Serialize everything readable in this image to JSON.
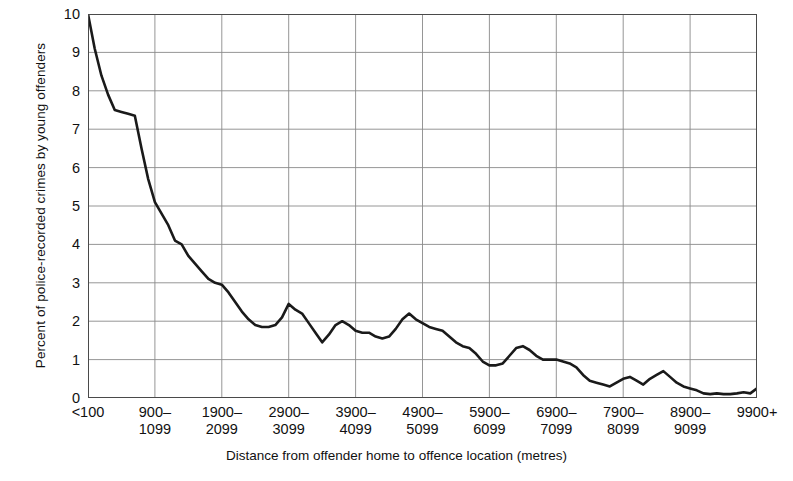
{
  "chart_data": {
    "type": "line",
    "title": "",
    "subtitle": "",
    "xlabel": "Distance from offender home to offence location (metres)",
    "ylabel": "Percent of police-recorded crimes by young offenders",
    "xlim": [
      0,
      100
    ],
    "ylim": [
      0,
      10
    ],
    "grid": true,
    "legend": null,
    "y_ticks": [
      10,
      9,
      8,
      7,
      6,
      5,
      4,
      3,
      2,
      1,
      0
    ],
    "y_tick_labels": [
      "10",
      "9",
      "8",
      "7",
      "6",
      "5",
      "4",
      "3",
      "2",
      "1",
      "0"
    ],
    "x_tick_positions": [
      0,
      10,
      20,
      30,
      40,
      50,
      60,
      70,
      80,
      90,
      100
    ],
    "x_tick_labels": [
      "<100",
      "900–\n1099",
      "1900–\n2099",
      "2900–\n3099",
      "3900–\n4099",
      "4900–\n5099",
      "5900–\n6099",
      "6900–\n7099",
      "7900–\n8099",
      "8900–\n9099",
      "9900+"
    ],
    "line_color": "#1a1a1a",
    "line_width": 2.6,
    "axis_color": "#4a4a4a",
    "grid_color": "#8a8a8a",
    "series": [
      {
        "name": "Percent of police-recorded crimes by young offenders",
        "x": [
          0,
          1,
          2,
          3,
          4,
          5,
          6,
          7,
          8,
          9,
          10,
          11,
          12,
          13,
          14,
          15,
          16,
          17,
          18,
          19,
          20,
          21,
          22,
          23,
          24,
          25,
          26,
          27,
          28,
          29,
          30,
          31,
          32,
          33,
          34,
          35,
          36,
          37,
          38,
          39,
          40,
          41,
          42,
          43,
          44,
          45,
          46,
          47,
          48,
          49,
          50,
          51,
          52,
          53,
          54,
          55,
          56,
          57,
          58,
          59,
          60,
          61,
          62,
          63,
          64,
          65,
          66,
          67,
          68,
          69,
          70,
          71,
          72,
          73,
          74,
          75,
          76,
          77,
          78,
          79,
          80,
          81,
          82,
          83,
          84,
          85,
          86,
          87,
          88,
          89,
          90,
          91,
          92,
          93,
          94,
          95,
          96,
          97,
          98,
          99,
          100
        ],
        "values": [
          10.0,
          9.1,
          8.4,
          7.9,
          7.5,
          7.45,
          7.4,
          7.35,
          6.5,
          5.7,
          5.1,
          4.8,
          4.5,
          4.1,
          4.0,
          3.7,
          3.5,
          3.3,
          3.1,
          3.0,
          2.95,
          2.75,
          2.5,
          2.25,
          2.05,
          1.9,
          1.85,
          1.85,
          1.9,
          2.1,
          2.45,
          2.3,
          2.2,
          1.95,
          1.7,
          1.45,
          1.65,
          1.9,
          2.0,
          1.9,
          1.75,
          1.7,
          1.7,
          1.6,
          1.55,
          1.6,
          1.8,
          2.05,
          2.2,
          2.05,
          1.95,
          1.85,
          1.8,
          1.75,
          1.6,
          1.45,
          1.35,
          1.3,
          1.15,
          0.95,
          0.85,
          0.85,
          0.9,
          1.1,
          1.3,
          1.35,
          1.25,
          1.1,
          1.0,
          1.0,
          1.0,
          0.95,
          0.9,
          0.8,
          0.6,
          0.45,
          0.4,
          0.35,
          0.3,
          0.4,
          0.5,
          0.55,
          0.45,
          0.35,
          0.5,
          0.6,
          0.7,
          0.55,
          0.4,
          0.3,
          0.25,
          0.2,
          0.12,
          0.1,
          0.12,
          0.1,
          0.1,
          0.12,
          0.15,
          0.12,
          0.25
        ]
      }
    ]
  }
}
